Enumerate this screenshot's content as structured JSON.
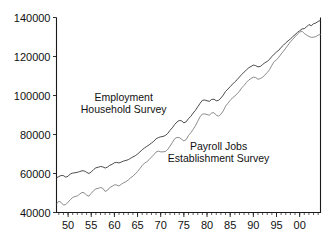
{
  "chart_data": {
    "type": "line",
    "title": "",
    "xlabel": "",
    "ylabel": "",
    "xlim": [
      1947.5,
      2004.5
    ],
    "ylim": [
      40000,
      140000
    ],
    "grid": false,
    "legend_position": "inline-annotations",
    "y_ticks": [
      40000,
      60000,
      80000,
      100000,
      120000,
      140000
    ],
    "y_tick_labels": [
      "40000",
      "60000",
      "80000",
      "100000",
      "120000",
      "140000"
    ],
    "x_ticks": [
      1950,
      1955,
      1960,
      1965,
      1970,
      1975,
      1980,
      1985,
      1990,
      1995,
      2000
    ],
    "x_tick_labels": [
      "50",
      "55",
      "60",
      "65",
      "70",
      "75",
      "80",
      "85",
      "90",
      "95",
      "00"
    ],
    "x_minor_tick_step": 1,
    "annotations": [
      {
        "id": "household-survey-label",
        "lines": [
          "Employment",
          "Household Survey"
        ],
        "x": 1962.0,
        "y": 97000
      },
      {
        "id": "establishment-survey-label",
        "lines": [
          "Payroll Jobs",
          "Establishment Survey"
        ],
        "x": 1982.5,
        "y": 72000
      }
    ],
    "series": [
      {
        "name": "Employment Household Survey",
        "color": "#2a2a2a",
        "x": [
          1947.5,
          1948,
          1948.5,
          1949,
          1949.5,
          1950,
          1950.5,
          1951,
          1951.5,
          1952,
          1952.5,
          1953,
          1953.5,
          1954,
          1954.5,
          1955,
          1955.5,
          1956,
          1956.5,
          1957,
          1957.5,
          1958,
          1958.5,
          1959,
          1959.5,
          1960,
          1960.5,
          1961,
          1961.5,
          1962,
          1962.5,
          1963,
          1963.5,
          1964,
          1964.5,
          1965,
          1965.5,
          1966,
          1966.5,
          1967,
          1967.5,
          1968,
          1968.5,
          1969,
          1969.5,
          1970,
          1970.5,
          1971,
          1971.5,
          1972,
          1972.5,
          1973,
          1973.5,
          1974,
          1974.5,
          1975,
          1975.5,
          1976,
          1976.5,
          1977,
          1977.5,
          1978,
          1978.5,
          1979,
          1979.5,
          1980,
          1980.5,
          1981,
          1981.5,
          1982,
          1982.5,
          1983,
          1983.5,
          1984,
          1984.5,
          1985,
          1985.5,
          1986,
          1986.5,
          1987,
          1987.5,
          1988,
          1988.5,
          1989,
          1989.5,
          1990,
          1990.5,
          1991,
          1991.5,
          1992,
          1992.5,
          1993,
          1993.5,
          1994,
          1994.5,
          1995,
          1995.5,
          1996,
          1996.5,
          1997,
          1997.5,
          1998,
          1998.5,
          1999,
          1999.5,
          2000,
          2000.5,
          2001,
          2001.5,
          2002,
          2002.5,
          2003,
          2003.5,
          2004,
          2004.5
        ],
        "y": [
          57800,
          58400,
          59000,
          58900,
          58100,
          58600,
          59800,
          60200,
          60400,
          60600,
          61000,
          61400,
          61300,
          60600,
          60000,
          60800,
          62000,
          62900,
          63200,
          63600,
          63400,
          62800,
          63300,
          64200,
          64700,
          65500,
          65700,
          65400,
          65900,
          66400,
          66700,
          67100,
          67800,
          68500,
          69100,
          70000,
          71000,
          72200,
          73100,
          73900,
          74700,
          75600,
          76500,
          77800,
          78400,
          78800,
          79000,
          79500,
          80500,
          82100,
          83400,
          85100,
          86400,
          87200,
          87000,
          86000,
          86500,
          88200,
          89300,
          91000,
          92400,
          94200,
          96000,
          97500,
          97700,
          97300,
          97000,
          98000,
          98100,
          97300,
          97500,
          98700,
          100200,
          102100,
          103300,
          104500,
          105800,
          107000,
          108100,
          109500,
          110800,
          112000,
          113100,
          114200,
          114900,
          115600,
          115300,
          114700,
          114900,
          115900,
          116800,
          117500,
          118500,
          120000,
          121200,
          122300,
          123200,
          124700,
          125800,
          127000,
          128000,
          129000,
          130100,
          131200,
          132300,
          133200,
          134100,
          134300,
          135200,
          136400,
          135800,
          136800,
          137200,
          138000,
          138500
        ]
      },
      {
        "name": "Payroll Jobs Establishment Survey",
        "color": "#6e6e6e",
        "x": [
          1947.5,
          1948,
          1948.5,
          1949,
          1949.5,
          1950,
          1950.5,
          1951,
          1951.5,
          1952,
          1952.5,
          1953,
          1953.5,
          1954,
          1954.5,
          1955,
          1955.5,
          1956,
          1956.5,
          1957,
          1957.5,
          1958,
          1958.5,
          1959,
          1959.5,
          1960,
          1960.5,
          1961,
          1961.5,
          1962,
          1962.5,
          1963,
          1963.5,
          1964,
          1964.5,
          1965,
          1965.5,
          1966,
          1966.5,
          1967,
          1967.5,
          1968,
          1968.5,
          1969,
          1969.5,
          1970,
          1970.5,
          1971,
          1971.5,
          1972,
          1972.5,
          1973,
          1973.5,
          1974,
          1974.5,
          1975,
          1975.5,
          1976,
          1976.5,
          1977,
          1977.5,
          1978,
          1978.5,
          1979,
          1979.5,
          1980,
          1980.5,
          1981,
          1981.5,
          1982,
          1982.5,
          1983,
          1983.5,
          1984,
          1984.5,
          1985,
          1985.5,
          1986,
          1986.5,
          1987,
          1987.5,
          1988,
          1988.5,
          1989,
          1989.5,
          1990,
          1990.5,
          1991,
          1991.5,
          1992,
          1992.5,
          1993,
          1993.5,
          1994,
          1994.5,
          1995,
          1995.5,
          1996,
          1996.5,
          1997,
          1997.5,
          1998,
          1998.5,
          1999,
          1999.5,
          2000,
          2000.5,
          2001,
          2001.5,
          2002,
          2002.5,
          2003,
          2003.5,
          2004,
          2004.5
        ],
        "y": [
          44300,
          45800,
          45200,
          43800,
          44100,
          45300,
          46600,
          47700,
          48200,
          48500,
          49400,
          50300,
          50100,
          48800,
          48400,
          49800,
          51200,
          52100,
          52400,
          52800,
          52400,
          50800,
          51400,
          52800,
          53400,
          54200,
          54100,
          53600,
          54500,
          55300,
          55800,
          56700,
          57800,
          58600,
          59800,
          61000,
          62500,
          64100,
          65300,
          66000,
          67100,
          68400,
          69600,
          71000,
          71500,
          71100,
          71100,
          71300,
          72300,
          74000,
          75800,
          77800,
          78500,
          78400,
          77600,
          76700,
          77400,
          79500,
          80900,
          82600,
          84500,
          86800,
          89100,
          90500,
          90600,
          90200,
          89900,
          91000,
          91200,
          89900,
          89400,
          90400,
          92100,
          94500,
          96000,
          97500,
          98800,
          99700,
          100900,
          102200,
          103900,
          105200,
          106700,
          107900,
          108700,
          109400,
          109200,
          108300,
          108700,
          109400,
          110500,
          111800,
          113300,
          115500,
          117400,
          118300,
          119600,
          121300,
          122700,
          124300,
          125900,
          127500,
          128800,
          130100,
          131400,
          132500,
          133000,
          131800,
          131000,
          130300,
          129800,
          129900,
          130200,
          131000,
          131300
        ]
      }
    ]
  },
  "axis": {
    "frame_color": "#1a1a1a"
  }
}
